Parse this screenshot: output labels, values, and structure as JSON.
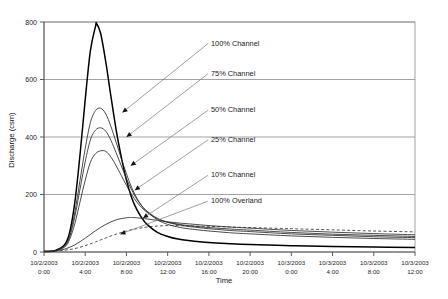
{
  "chart_data": {
    "type": "line",
    "title": "",
    "xlabel": "Time",
    "ylabel": "Discharge (csm)",
    "ylim": [
      0,
      800
    ],
    "yticks": [
      0,
      200,
      400,
      600,
      800
    ],
    "grid": true,
    "legend_position": "inline-annotations",
    "x_unit": "hours from 10/2/2003 0:00",
    "xlim_hours": [
      0,
      36
    ],
    "xticks": [
      {
        "date": "10/2/2003",
        "time": "0:00",
        "hours": 0
      },
      {
        "date": "10/2/2003",
        "time": "4:00",
        "hours": 4
      },
      {
        "date": "10/2/2003",
        "time": "8:00",
        "hours": 8
      },
      {
        "date": "10/2/2003",
        "time": "12:00",
        "hours": 12
      },
      {
        "date": "10/2/2003",
        "time": "16:00",
        "hours": 16
      },
      {
        "date": "10/2/2003",
        "time": "20:00",
        "hours": 20
      },
      {
        "date": "10/3/2003",
        "time": "0:00",
        "hours": 24
      },
      {
        "date": "10/3/2003",
        "time": "4:00",
        "hours": 28
      },
      {
        "date": "10/3/2003",
        "time": "8:00",
        "hours": 32
      },
      {
        "date": "10/3/2003",
        "time": "12:00",
        "hours": 36
      }
    ],
    "series": [
      {
        "name": "100% Channel",
        "style": "solid-thick",
        "peak_value": 795,
        "peak_hours": 5.1,
        "x": [
          0,
          1,
          2,
          2.5,
          3,
          3.5,
          4,
          4.5,
          5,
          5.1,
          5.5,
          6,
          6.5,
          7,
          7.5,
          8,
          8.5,
          9,
          9.5,
          10,
          11,
          12,
          13,
          14,
          16,
          18,
          20,
          24,
          28,
          32,
          36
        ],
        "values": [
          2,
          4,
          25,
          70,
          175,
          340,
          530,
          700,
          785,
          795,
          760,
          660,
          540,
          425,
          330,
          250,
          190,
          148,
          118,
          96,
          68,
          54,
          45,
          40,
          33,
          29,
          26,
          22,
          19,
          17,
          16
        ]
      },
      {
        "name": "75% Channel",
        "style": "solid",
        "peak_value": 500,
        "peak_hours": 5.5,
        "x": [
          0,
          1,
          2,
          2.5,
          3,
          3.5,
          4,
          4.5,
          5,
          5.5,
          6,
          6.5,
          7,
          7.5,
          8,
          8.5,
          9,
          9.5,
          10,
          11,
          12,
          13,
          14,
          16,
          18,
          20,
          24,
          28,
          32,
          36
        ],
        "values": [
          2,
          4,
          22,
          60,
          140,
          250,
          360,
          450,
          492,
          500,
          480,
          436,
          382,
          325,
          272,
          225,
          188,
          160,
          140,
          112,
          96,
          87,
          81,
          73,
          67,
          63,
          56,
          51,
          47,
          44
        ]
      },
      {
        "name": "50% Channel",
        "style": "solid",
        "peak_value": 432,
        "peak_hours": 5.7,
        "x": [
          0,
          1,
          2,
          2.5,
          3,
          3.5,
          4,
          4.5,
          5,
          5.5,
          6,
          6.5,
          7,
          7.5,
          8,
          8.5,
          9,
          9.5,
          10,
          11,
          12,
          13,
          14,
          16,
          18,
          20,
          24,
          28,
          32,
          36
        ],
        "values": [
          2,
          4,
          20,
          54,
          124,
          220,
          314,
          390,
          424,
          432,
          420,
          388,
          345,
          300,
          256,
          216,
          184,
          160,
          142,
          117,
          103,
          95,
          89,
          81,
          75,
          71,
          63,
          58,
          53,
          50
        ]
      },
      {
        "name": "25% Channel",
        "style": "solid",
        "peak_value": 352,
        "peak_hours": 6.0,
        "x": [
          0,
          1,
          2,
          2.5,
          3,
          3.5,
          4,
          4.5,
          5,
          5.5,
          6,
          6.5,
          7,
          7.5,
          8,
          8.5,
          9,
          9.5,
          10,
          11,
          12,
          13,
          14,
          16,
          18,
          20,
          24,
          28,
          32,
          36
        ],
        "values": [
          2,
          4,
          17,
          45,
          100,
          175,
          250,
          312,
          342,
          352,
          350,
          330,
          300,
          266,
          232,
          200,
          174,
          154,
          138,
          116,
          104,
          97,
          92,
          85,
          80,
          76,
          68,
          62,
          58,
          54
        ]
      },
      {
        "name": "10% Channel",
        "style": "solid",
        "peak_value": 120,
        "peak_hours": 8.5,
        "x": [
          0,
          1,
          2,
          3,
          4,
          5,
          6,
          7,
          8,
          8.5,
          9,
          10,
          11,
          12,
          13,
          14,
          16,
          18,
          20,
          24,
          28,
          32,
          36
        ],
        "values": [
          2,
          4,
          10,
          25,
          48,
          74,
          96,
          112,
          119,
          120,
          119,
          115,
          110,
          105,
          101,
          98,
          92,
          87,
          83,
          75,
          69,
          64,
          60
        ]
      },
      {
        "name": "100% Overland",
        "style": "dashed",
        "peak_value": 92,
        "peak_hours": 13.0,
        "x": [
          0,
          1,
          2,
          3,
          4,
          5,
          6,
          7,
          8,
          9,
          10,
          11,
          12,
          13,
          14,
          16,
          18,
          20,
          24,
          28,
          32,
          36
        ],
        "values": [
          2,
          3,
          6,
          12,
          22,
          35,
          49,
          62,
          73,
          81,
          87,
          90,
          92,
          92,
          91,
          89,
          87,
          85,
          81,
          77,
          73,
          70
        ]
      }
    ],
    "annotations": [
      {
        "label": "100% Channel",
        "label_x_hours": 16.2,
        "label_y_value": 730,
        "arrow_x_hours": 7.6,
        "arrow_y_value": 485
      },
      {
        "label": "75% Channel",
        "label_x_hours": 16.2,
        "label_y_value": 625,
        "arrow_x_hours": 8.0,
        "arrow_y_value": 400
      },
      {
        "label": "50% Channel",
        "label_x_hours": 16.2,
        "label_y_value": 498,
        "arrow_x_hours": 8.4,
        "arrow_y_value": 300
      },
      {
        "label": "25% Channel",
        "label_x_hours": 16.2,
        "label_y_value": 395,
        "arrow_x_hours": 8.8,
        "arrow_y_value": 215
      },
      {
        "label": "10% Channel",
        "label_x_hours": 16.2,
        "label_y_value": 272,
        "arrow_x_hours": 9.6,
        "arrow_y_value": 118
      },
      {
        "label": "100% Overland",
        "label_x_hours": 16.2,
        "label_y_value": 182,
        "arrow_x_hours": 7.4,
        "arrow_y_value": 62
      }
    ]
  }
}
